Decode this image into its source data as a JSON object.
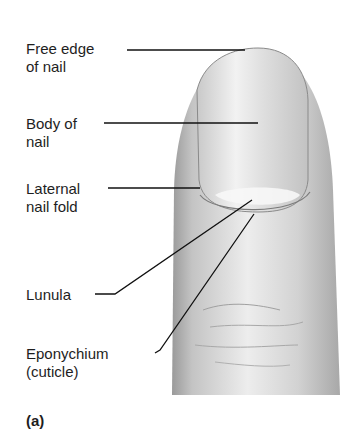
{
  "figure": {
    "panel_label": "(a)",
    "labels": [
      {
        "id": "free-edge",
        "line1": "Free edge",
        "line2": "of nail"
      },
      {
        "id": "body",
        "line1": "Body of",
        "line2": "nail"
      },
      {
        "id": "lateral-fold",
        "line1": "Laternal",
        "line2": "nail fold"
      },
      {
        "id": "lunula",
        "line1": "Lunula",
        "line2": ""
      },
      {
        "id": "eponychium",
        "line1": "Eponychium",
        "line2": "(cuticle)"
      }
    ]
  }
}
